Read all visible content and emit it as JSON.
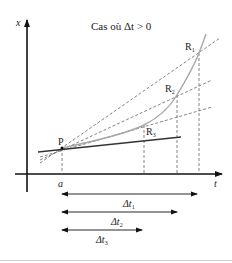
{
  "title": "Cas où Δt > 0",
  "axes": {
    "y_label": "x",
    "x_label": "t",
    "tick_label": "a"
  },
  "points": {
    "P": "P",
    "R1": {
      "base": "R",
      "sub": "1"
    },
    "R2": {
      "base": "R",
      "sub": "2"
    },
    "R3": {
      "base": "R",
      "sub": "3"
    }
  },
  "intervals": [
    {
      "base": "Δt",
      "sub": "1"
    },
    {
      "base": "Δt",
      "sub": "2"
    },
    {
      "base": "Δt",
      "sub": "3"
    }
  ],
  "colors": {
    "axis": "#111111",
    "curve": "#a8a8a8",
    "tangent": "#333333",
    "dashed": "#666666"
  }
}
